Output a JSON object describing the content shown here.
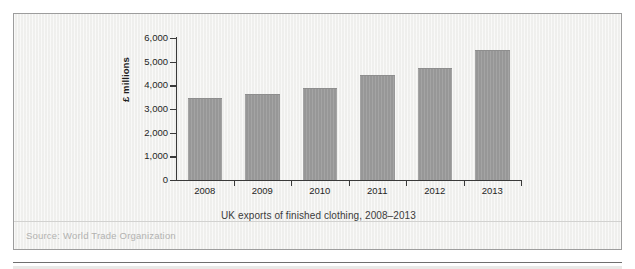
{
  "chart_data": {
    "type": "bar",
    "title": "UK exports of finished clothing, 2008–2013",
    "xlabel": "",
    "ylabel": "£ millions",
    "categories": [
      "2008",
      "2009",
      "2010",
      "2011",
      "2012",
      "2013"
    ],
    "values": [
      3450,
      3620,
      3880,
      4430,
      4750,
      5500
    ],
    "ylim": [
      0,
      6000
    ],
    "ytick_labels": [
      "0",
      "1,000",
      "2,000",
      "3,000",
      "4,000",
      "5,000",
      "6,000"
    ],
    "ytick_values": [
      0,
      1000,
      2000,
      3000,
      4000,
      5000,
      6000
    ],
    "grid": false,
    "legend": false,
    "series": [
      {
        "name": "UK exports of finished clothing",
        "values": [
          3450,
          3620,
          3880,
          4430,
          4750,
          5500
        ]
      }
    ],
    "bar_color": "#9a9a9a",
    "axis_color": "#3a3a3a"
  },
  "figure": {
    "caption": "UK exports of finished clothing, 2008–2013",
    "source": "Source: World Trade Organization",
    "panel_background": "#f2f2f0",
    "panel_border_color": "#9d9d9d"
  }
}
